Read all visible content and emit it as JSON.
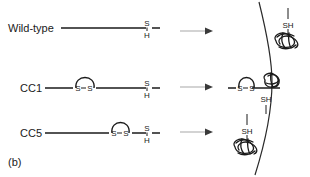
{
  "figure": {
    "panel_label": "(b)",
    "membrane_label": "membrane",
    "rows": [
      {
        "id": "wild-type",
        "construct_label": "Wild-type",
        "terminus_top": "S",
        "terminus_bottom": "H",
        "has_disulfide_loop": false,
        "disulfide_left": "S",
        "disulfide_right": "S",
        "product_label": "SH",
        "product_side": "inside",
        "translocated": true,
        "y": 28
      },
      {
        "id": "cc1",
        "construct_label": "CC1",
        "terminus_top": "S",
        "terminus_bottom": "H",
        "has_disulfide_loop": true,
        "disulfide_left": "S",
        "disulfide_right": "S",
        "product_label": "SH",
        "product_side": "spanning",
        "translocated": false,
        "y": 88
      },
      {
        "id": "cc5",
        "construct_label": "CC5",
        "terminus_top": "S",
        "terminus_bottom": "H",
        "has_disulfide_loop": true,
        "disulfide_left": "S",
        "disulfide_right": "S",
        "product_label": "SH",
        "product_side": "outside",
        "translocated": false,
        "y": 133
      }
    ],
    "colors": {
      "ink": "#1a1a1a",
      "membrane": "#2a2a2a",
      "arrow_shaft": "#b0b0b0",
      "arrow_head": "#3a3a3a",
      "background": "#ffffff"
    }
  }
}
